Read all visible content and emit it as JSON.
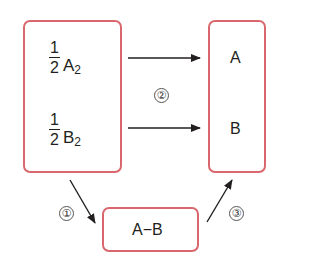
{
  "diagram": {
    "left_box": {
      "terms": [
        {
          "numerator": "1",
          "denominator": "2",
          "variable": "A",
          "subscript": "2"
        },
        {
          "numerator": "1",
          "denominator": "2",
          "variable": "B",
          "subscript": "2"
        }
      ]
    },
    "right_box": {
      "labels": [
        "A",
        "B"
      ]
    },
    "bottom_box": {
      "label": "A−B"
    },
    "steps": [
      "①",
      "②",
      "③"
    ],
    "colors": {
      "box_border": "#d9686e",
      "arrow": "#231f20",
      "text": "#231f20"
    },
    "edges": [
      {
        "from": "left_box",
        "to": "bottom_box",
        "step": "①"
      },
      {
        "from": "left_box",
        "to": "right_box",
        "step": "②"
      },
      {
        "from": "bottom_box",
        "to": "right_box",
        "step": "③"
      }
    ]
  }
}
